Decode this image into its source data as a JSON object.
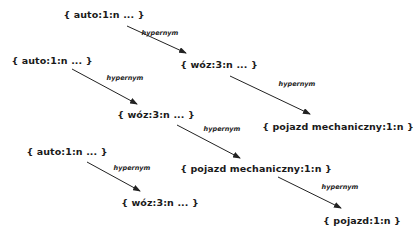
{
  "diagram": {
    "colors": {
      "text": "#1a1a1a",
      "edge": "#222222",
      "background": "#ffffff"
    },
    "nodes": [
      {
        "id": "a1",
        "label": "{ auto:1:n ... }",
        "x": 104,
        "y": 14
      },
      {
        "id": "w1",
        "label": "{ wóz:3:n ... }",
        "x": 219,
        "y": 64
      },
      {
        "id": "p1",
        "label": "{ pojazd mechaniczny:1:n }",
        "x": 338,
        "y": 126
      },
      {
        "id": "a2",
        "label": "{ auto:1:n ... }",
        "x": 52,
        "y": 60
      },
      {
        "id": "w2",
        "label": "{ wóz:3:n ... }",
        "x": 156,
        "y": 114
      },
      {
        "id": "p2",
        "label": "{ pojazd mechaniczny:1:n }",
        "x": 256,
        "y": 168
      },
      {
        "id": "a3",
        "label": "{ auto:1:n ... }",
        "x": 67,
        "y": 151
      },
      {
        "id": "w3",
        "label": "{ wóz:3:n ... }",
        "x": 160,
        "y": 202
      },
      {
        "id": "p3",
        "label": "{ pojazd:1:n }",
        "x": 362,
        "y": 220
      }
    ],
    "edges": [
      {
        "from": "a1",
        "to": "w1",
        "label": "hypernym",
        "x1": 127,
        "y1": 26,
        "x2": 186,
        "y2": 53,
        "lx": 160,
        "ly": 33
      },
      {
        "from": "w1",
        "to": "p1",
        "label": "hypernym",
        "x1": 230,
        "y1": 76,
        "x2": 310,
        "y2": 114,
        "lx": 297,
        "ly": 84
      },
      {
        "from": "a2",
        "to": "w2",
        "label": "hypernym",
        "x1": 72,
        "y1": 69,
        "x2": 137,
        "y2": 104,
        "lx": 125,
        "ly": 78
      },
      {
        "from": "w2",
        "to": "p2",
        "label": "hypernym",
        "x1": 177,
        "y1": 125,
        "x2": 240,
        "y2": 158,
        "lx": 222,
        "ly": 129
      },
      {
        "from": "a3",
        "to": "w3",
        "label": "hypernym",
        "x1": 87,
        "y1": 162,
        "x2": 140,
        "y2": 191,
        "lx": 132,
        "ly": 168
      },
      {
        "from": "p2",
        "to": "p3",
        "label": "hypernym",
        "x1": 278,
        "y1": 177,
        "x2": 341,
        "y2": 208,
        "lx": 340,
        "ly": 187
      }
    ]
  }
}
